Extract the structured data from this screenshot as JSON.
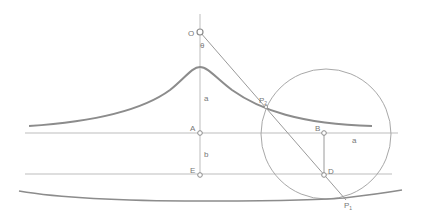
{
  "diagram": {
    "colors": {
      "thin_line": "#b5b5b5",
      "curve": "#8c8c8c",
      "label": "#777777",
      "point_fill": "#ffffff"
    },
    "labels": {
      "O": "O",
      "theta": "θ",
      "a_vertical": "a",
      "P2": "P",
      "P2_sub": "2",
      "A": "A",
      "b": "b",
      "E": "E",
      "B": "B",
      "a_horizontal": "a",
      "D": "D",
      "P1": "P",
      "P1_sub": "1"
    },
    "points": {
      "O": [
        200,
        32
      ],
      "peak": [
        200,
        67
      ],
      "A": [
        200,
        133
      ],
      "E": [
        200,
        176
      ],
      "B": [
        324,
        133
      ],
      "D": [
        324,
        176
      ],
      "P2": [
        266,
        106
      ],
      "P1": [
        344,
        198
      ]
    },
    "circle": {
      "cx": 326,
      "cy": 134,
      "r": 65
    }
  }
}
